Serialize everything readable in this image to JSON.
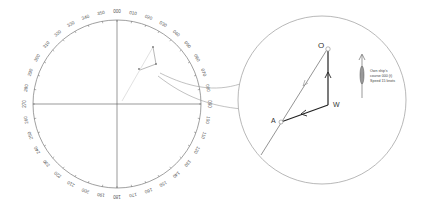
{
  "diagram": {
    "compass": {
      "labels": [
        "000",
        "010",
        "020",
        "030",
        "040",
        "050",
        "060",
        "070",
        "080",
        "090",
        "100",
        "110",
        "120",
        "130",
        "140",
        "150",
        "160",
        "170",
        "180",
        "190",
        "200",
        "210",
        "220",
        "230",
        "240",
        "250",
        "260",
        "270",
        "280",
        "290",
        "300",
        "310",
        "320",
        "330",
        "340",
        "350"
      ]
    },
    "detail": {
      "point_o": "O",
      "point_w": "W",
      "point_a": "A",
      "annotation": {
        "line1": "Own ship's",
        "line2": "course 000 (t)",
        "line3": "Speed 15 knots"
      }
    },
    "colors": {
      "line": "#555555",
      "light_line": "#aaaaaa",
      "vector": "#222222",
      "label": "#444444"
    }
  }
}
